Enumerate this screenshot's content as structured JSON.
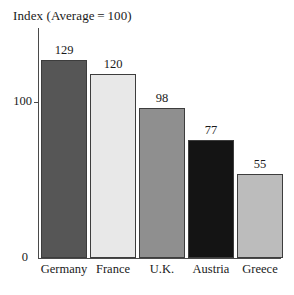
{
  "chart_data": {
    "type": "bar",
    "title": "Index (Average = 100)",
    "xlabel": "",
    "ylabel": "",
    "categories": [
      "Germany",
      "France",
      "U.K.",
      "Austria",
      "Greece"
    ],
    "values": [
      129,
      120,
      98,
      77,
      55
    ],
    "value_labels": [
      "129",
      "120",
      "98",
      "77",
      "55"
    ],
    "ylim": [
      0,
      150
    ],
    "y_ticks": [
      0,
      100
    ],
    "y_tick_labels": [
      "0",
      "100"
    ],
    "grid": false,
    "legend": "none",
    "bar_colors": [
      "#565656",
      "#e8e8e8",
      "#8f8f8f",
      "#141414",
      "#bcbcbc"
    ],
    "bar_border_color": "#3d3d3d",
    "axis_color": "#4a4a4a"
  }
}
